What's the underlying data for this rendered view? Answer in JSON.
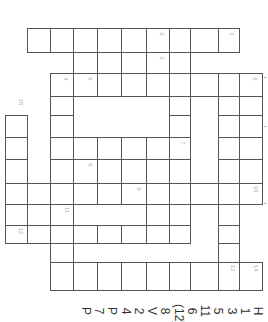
{
  "puzzle": {
    "type": "crossword",
    "orientation": "rotated-90",
    "cells": [
      {
        "c": 1,
        "r": 0
      },
      {
        "c": 2,
        "r": 0
      },
      {
        "c": 3,
        "r": 0
      },
      {
        "c": 4,
        "r": 0
      },
      {
        "c": 5,
        "r": 0
      },
      {
        "c": 6,
        "r": 0
      },
      {
        "c": 7,
        "r": 0
      },
      {
        "c": 8,
        "r": 0
      },
      {
        "c": 9,
        "r": 0
      },
      {
        "c": 3,
        "r": 1
      },
      {
        "c": 4,
        "r": 1
      },
      {
        "c": 5,
        "r": 1
      },
      {
        "c": 6,
        "r": 1
      },
      {
        "c": 7,
        "r": 1
      },
      {
        "c": 2,
        "r": 2
      },
      {
        "c": 3,
        "r": 2
      },
      {
        "c": 4,
        "r": 2
      },
      {
        "c": 5,
        "r": 2
      },
      {
        "c": 6,
        "r": 2
      },
      {
        "c": 7,
        "r": 2
      },
      {
        "c": 8,
        "r": 2
      },
      {
        "c": 9,
        "r": 2
      },
      {
        "c": 10,
        "r": 2
      },
      {
        "c": 2,
        "r": 3
      },
      {
        "c": 7,
        "r": 3
      },
      {
        "c": 9,
        "r": 3
      },
      {
        "c": 10,
        "r": 3
      },
      {
        "c": 0,
        "r": 4
      },
      {
        "c": 2,
        "r": 4
      },
      {
        "c": 7,
        "r": 4
      },
      {
        "c": 9,
        "r": 4
      },
      {
        "c": 10,
        "r": 4
      },
      {
        "c": 0,
        "r": 5
      },
      {
        "c": 2,
        "r": 5
      },
      {
        "c": 3,
        "r": 5
      },
      {
        "c": 4,
        "r": 5
      },
      {
        "c": 5,
        "r": 5
      },
      {
        "c": 6,
        "r": 5
      },
      {
        "c": 7,
        "r": 5
      },
      {
        "c": 9,
        "r": 5
      },
      {
        "c": 10,
        "r": 5
      },
      {
        "c": 0,
        "r": 6
      },
      {
        "c": 2,
        "r": 6
      },
      {
        "c": 3,
        "r": 6
      },
      {
        "c": 4,
        "r": 6
      },
      {
        "c": 5,
        "r": 6
      },
      {
        "c": 6,
        "r": 6
      },
      {
        "c": 7,
        "r": 6
      },
      {
        "c": 9,
        "r": 6
      },
      {
        "c": 10,
        "r": 6
      },
      {
        "c": 0,
        "r": 7
      },
      {
        "c": 1,
        "r": 7
      },
      {
        "c": 2,
        "r": 7
      },
      {
        "c": 3,
        "r": 7
      },
      {
        "c": 4,
        "r": 7
      },
      {
        "c": 5,
        "r": 7
      },
      {
        "c": 6,
        "r": 7
      },
      {
        "c": 7,
        "r": 7
      },
      {
        "c": 8,
        "r": 7
      },
      {
        "c": 9,
        "r": 7
      },
      {
        "c": 10,
        "r": 7
      },
      {
        "c": 0,
        "r": 8
      },
      {
        "c": 1,
        "r": 8
      },
      {
        "c": 2,
        "r": 8
      },
      {
        "c": 6,
        "r": 8
      },
      {
        "c": 7,
        "r": 8
      },
      {
        "c": 9,
        "r": 8
      },
      {
        "c": 0,
        "r": 9
      },
      {
        "c": 1,
        "r": 9
      },
      {
        "c": 2,
        "r": 9
      },
      {
        "c": 3,
        "r": 9
      },
      {
        "c": 4,
        "r": 9
      },
      {
        "c": 5,
        "r": 9
      },
      {
        "c": 6,
        "r": 9
      },
      {
        "c": 7,
        "r": 9
      },
      {
        "c": 9,
        "r": 9
      },
      {
        "c": 2,
        "r": 10
      },
      {
        "c": 9,
        "r": 10
      },
      {
        "c": 2,
        "r": 11
      },
      {
        "c": 3,
        "r": 11
      },
      {
        "c": 4,
        "r": 11
      },
      {
        "c": 5,
        "r": 11
      },
      {
        "c": 6,
        "r": 11
      },
      {
        "c": 7,
        "r": 11
      },
      {
        "c": 8,
        "r": 11
      },
      {
        "c": 9,
        "r": 11
      },
      {
        "c": 10,
        "r": 11
      }
    ],
    "numbers": [
      {
        "c": 9,
        "r": 0,
        "n": "1"
      },
      {
        "c": 6,
        "r": 0,
        "n": "2"
      },
      {
        "c": 6,
        "r": 1,
        "n": "3"
      },
      {
        "c": 2,
        "r": 2,
        "n": "4"
      },
      {
        "c": 3,
        "r": 2,
        "n": "5"
      },
      {
        "c": 10,
        "r": 2,
        "n": "6"
      },
      {
        "c": 7,
        "r": 5,
        "n": "7"
      },
      {
        "c": 3,
        "r": 6,
        "n": "8"
      },
      {
        "c": 5,
        "r": 7,
        "n": "9"
      },
      {
        "c": 10,
        "r": 7,
        "n": "10"
      },
      {
        "c": 2,
        "r": 8,
        "n": "11"
      },
      {
        "c": 0,
        "r": 9,
        "n": "12"
      },
      {
        "c": 9,
        "r": 11,
        "n": "13"
      },
      {
        "c": 10,
        "r": 11,
        "n": "14"
      },
      {
        "c": 0,
        "r": 3,
        "n": "15"
      }
    ]
  },
  "legend": {
    "items": [
      "P",
      "7",
      "P",
      "4",
      "2",
      "V",
      "8",
      "(12)",
      "6",
      "11",
      "5",
      "3",
      "1",
      "H"
    ]
  },
  "ticks": [
    {
      "y": 78,
      "label": "-"
    },
    {
      "y": 127,
      "label": "-"
    },
    {
      "y": 204,
      "label": "-"
    }
  ]
}
